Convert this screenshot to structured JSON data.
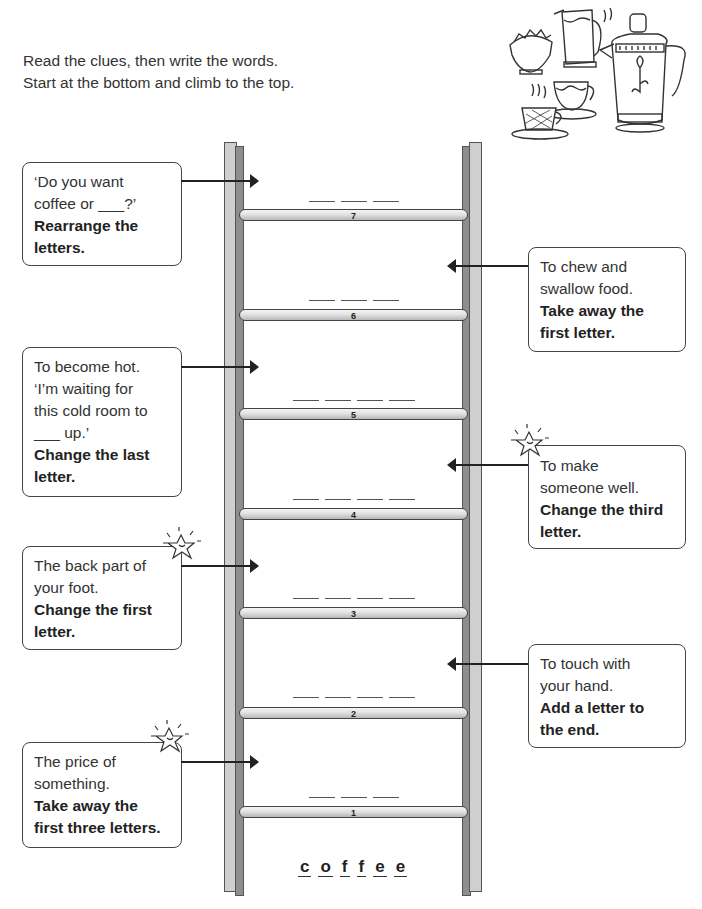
{
  "instructions": {
    "line1": "Read the clues, then write the words.",
    "line2": "Start at the bottom and climb to the top."
  },
  "illustration": {
    "icon": "coffee-set-icon",
    "description": "Coffee pot, milk jug, sugar bowl and cups"
  },
  "ladder": {
    "start_word": [
      "c",
      "o",
      "f",
      "f",
      "e",
      "e"
    ],
    "rungs": [
      {
        "number": "7",
        "letters": 3
      },
      {
        "number": "6",
        "letters": 3
      },
      {
        "number": "5",
        "letters": 4
      },
      {
        "number": "4",
        "letters": 4
      },
      {
        "number": "3",
        "letters": 4
      },
      {
        "number": "2",
        "letters": 4
      },
      {
        "number": "1",
        "letters": 3
      }
    ]
  },
  "clues": [
    {
      "rung": "7",
      "side": "left",
      "lines": [
        "‘Do you want",
        "coffee or ___?’"
      ],
      "rule_lines": [
        "Rearrange the",
        "letters."
      ],
      "star": false
    },
    {
      "rung": "6",
      "side": "right",
      "lines": [
        "To chew and",
        "swallow food."
      ],
      "rule_lines": [
        "Take away the",
        "first letter."
      ],
      "star": false
    },
    {
      "rung": "5",
      "side": "left",
      "lines": [
        "To become hot.",
        "‘I’m waiting for",
        "this cold room to",
        "___ up.’"
      ],
      "rule_lines": [
        "Change the last",
        "letter."
      ],
      "star": false
    },
    {
      "rung": "4",
      "side": "right",
      "lines": [
        "To make",
        "someone well."
      ],
      "rule_lines": [
        "Change the third",
        "letter."
      ],
      "star": true
    },
    {
      "rung": "3",
      "side": "left",
      "lines": [
        "The back part of",
        "your foot."
      ],
      "rule_lines": [
        "Change the first",
        "letter."
      ],
      "star": true
    },
    {
      "rung": "2",
      "side": "right",
      "lines": [
        "To touch with",
        "your hand."
      ],
      "rule_lines": [
        "Add a letter to",
        "the end."
      ],
      "star": false
    },
    {
      "rung": "1",
      "side": "left",
      "lines": [
        "The price of",
        "something."
      ],
      "rule_lines": [
        "Take away the",
        "first three letters."
      ],
      "star": true
    }
  ]
}
